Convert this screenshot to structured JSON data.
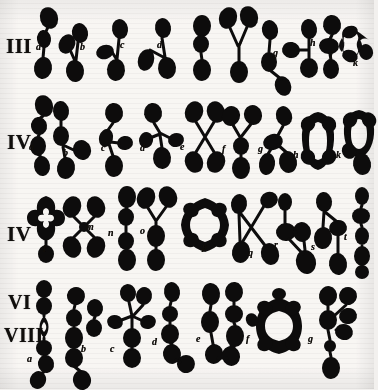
{
  "plate": {
    "title": "Chromosome figure plate",
    "background_color": "#f3f1ef",
    "ink_color": "#111010",
    "width": 374,
    "height": 389
  },
  "rows": [
    {
      "numerals": [
        "III"
      ],
      "numeral_text": "III",
      "figures": [
        {
          "label": "a"
        },
        {
          "label": "b"
        },
        {
          "label": "c"
        },
        {
          "label": "d"
        },
        {
          "label": "e"
        },
        {
          "label": "f"
        },
        {
          "label": "g"
        },
        {
          "label": "h"
        },
        {
          "label": "j"
        },
        {
          "label": "k"
        }
      ]
    },
    {
      "numerals": [
        "IV"
      ],
      "numeral_text": "IV",
      "figures": [
        {
          "label": "a"
        },
        {
          "label": "b"
        },
        {
          "label": "c"
        },
        {
          "label": "d"
        },
        {
          "label": "e"
        },
        {
          "label": "f"
        },
        {
          "label": "g"
        },
        {
          "label": "h"
        },
        {
          "label": "k"
        }
      ]
    },
    {
      "numerals": [
        "IV"
      ],
      "numeral_text": "IV",
      "figures": [
        {
          "label": "l"
        },
        {
          "label": "m"
        },
        {
          "label": "n"
        },
        {
          "label": "o"
        },
        {
          "label": "p"
        },
        {
          "label": "q"
        },
        {
          "label": "r"
        },
        {
          "label": "s"
        },
        {
          "label": "t"
        }
      ]
    },
    {
      "numerals": [
        "VI",
        "VIII"
      ],
      "numeral_text": "VI",
      "numeral_text_2": "VIII",
      "figures": [
        {
          "label": "a"
        },
        {
          "label": "b"
        },
        {
          "label": "c"
        },
        {
          "label": "d"
        },
        {
          "label": "e"
        },
        {
          "label": "f"
        },
        {
          "label": "g"
        }
      ]
    }
  ]
}
